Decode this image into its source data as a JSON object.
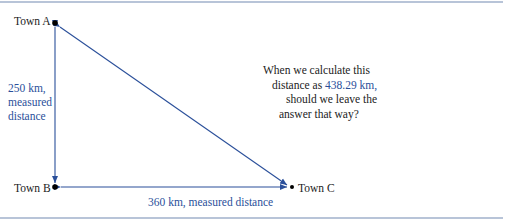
{
  "diagram": {
    "towns": {
      "a": "Town A",
      "b": "Town B",
      "c": "Town C"
    },
    "vertical_label": {
      "line1": "250 km,",
      "line2": "measured",
      "line3": "distance"
    },
    "horizontal_label": "360 km, measured distance",
    "question": {
      "line1": "When we calculate this",
      "line2_prefix": "distance as ",
      "line2_value": "438.29 km",
      "line2_suffix": ",",
      "line3": "should we leave the",
      "line4": "answer that way?"
    },
    "colors": {
      "arrow": "#2a4f9a",
      "text": "#222222",
      "highlight": "#2a4f9a",
      "rule": "#b8c4d8"
    }
  }
}
